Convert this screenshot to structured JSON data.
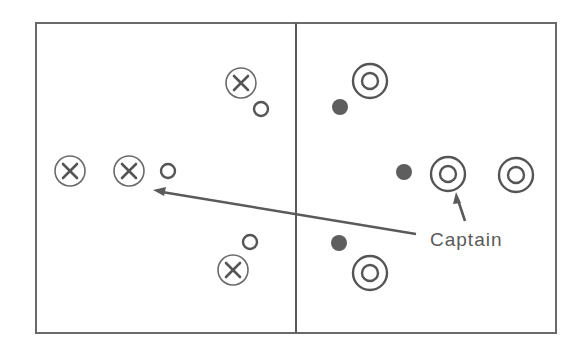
{
  "diagram": {
    "type": "tactical-formation",
    "frame": {
      "x": 36,
      "y": 23,
      "width": 520,
      "height": 310
    },
    "divider_x": 296,
    "left_team": {
      "crossed_circles": [
        {
          "id": "x1",
          "cx": 241,
          "cy": 83
        },
        {
          "id": "x2",
          "cx": 70,
          "cy": 171
        },
        {
          "id": "x3",
          "cx": 129,
          "cy": 171
        },
        {
          "id": "x4",
          "cx": 233,
          "cy": 270
        }
      ],
      "open_circles": [
        {
          "id": "o1",
          "cx": 261,
          "cy": 109
        },
        {
          "id": "o2",
          "cx": 168,
          "cy": 171
        },
        {
          "id": "o3",
          "cx": 250,
          "cy": 242
        }
      ]
    },
    "right_team": {
      "double_circles": [
        {
          "id": "t1",
          "cx": 370,
          "cy": 81
        },
        {
          "id": "t2",
          "cx": 448,
          "cy": 174,
          "role": "captain"
        },
        {
          "id": "t3",
          "cx": 516,
          "cy": 175
        },
        {
          "id": "t4",
          "cx": 370,
          "cy": 273
        }
      ],
      "filled_dots": [
        {
          "id": "d1",
          "cx": 340,
          "cy": 107
        },
        {
          "id": "d2",
          "cx": 404,
          "cy": 172
        },
        {
          "id": "d3",
          "cx": 339,
          "cy": 243
        }
      ]
    },
    "arrows": [
      {
        "id": "pass-arrow",
        "from": [
          416,
          234
        ],
        "to": [
          155,
          191
        ]
      },
      {
        "id": "captain-pointer",
        "from": [
          465,
          222
        ],
        "to": [
          456,
          194
        ]
      }
    ],
    "labels": {
      "captain": "Captain"
    }
  }
}
